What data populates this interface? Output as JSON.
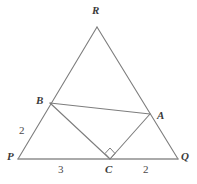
{
  "figure": {
    "type": "geometry-diagram",
    "background_color": "#ffffff",
    "stroke_color": "#7d7d7d",
    "label_color": "#3b3b3b",
    "length_label_color": "#4a4a4a"
  },
  "points": {
    "P": {
      "label": "P",
      "x": 18,
      "y": 159,
      "label_x": 7,
      "label_y": 155
    },
    "Q": {
      "label": "Q",
      "x": 178,
      "y": 159,
      "label_x": 181,
      "label_y": 155
    },
    "R": {
      "label": "R",
      "x": 97,
      "y": 27,
      "label_x": 92,
      "label_y": 5
    },
    "A": {
      "label": "A",
      "x": 150,
      "y": 114,
      "label_x": 157,
      "label_y": 110
    },
    "B": {
      "label": "B",
      "x": 50,
      "y": 103,
      "label_x": 36,
      "label_y": 93
    },
    "C": {
      "label": "C",
      "x": 110,
      "y": 159,
      "label_x": 105,
      "label_y": 164
    }
  },
  "segments": [
    {
      "name": "side-PR",
      "from": "P",
      "to": "R"
    },
    {
      "name": "side-RQ",
      "from": "R",
      "to": "Q"
    },
    {
      "name": "side-PQ",
      "from": "P",
      "to": "Q"
    },
    {
      "name": "segment-BA",
      "from": "B",
      "to": "A"
    },
    {
      "name": "segment-BC",
      "from": "B",
      "to": "C"
    },
    {
      "name": "segment-CA",
      "from": "C",
      "to": "A"
    }
  ],
  "length_labels": [
    {
      "name": "length-PB",
      "value": "2",
      "x": 19,
      "y": 125,
      "for_segment": "P-B"
    },
    {
      "name": "length-PC",
      "value": "3",
      "x": 58,
      "y": 164,
      "for_segment": "P-C"
    },
    {
      "name": "length-CQ",
      "value": "2",
      "x": 143,
      "y": 164,
      "for_segment": "C-Q"
    }
  ],
  "right_angle": {
    "name": "right-angle-marker-at-C",
    "at_point": "C",
    "center_x": 110,
    "center_y": 153,
    "half_size": 5,
    "shape": "diamond"
  }
}
